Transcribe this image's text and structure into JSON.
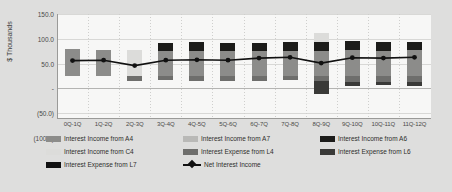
{
  "chart_data": {
    "type": "bar",
    "title": "",
    "subtitle": "",
    "xlabel": "",
    "ylabel": "$ Thousands",
    "ylim": [
      -100.0,
      150.0
    ],
    "ytick_labels": [
      "150.0",
      "100.0",
      "50.0",
      "-",
      "(50.0)",
      "(100.0)"
    ],
    "ytick_values": [
      150.0,
      100.0,
      50.0,
      0.0,
      -50.0,
      -100.0
    ],
    "grid": true,
    "grid_vertical_dotted": true,
    "legend_position": "bottom",
    "stacked": true,
    "categories": [
      "0Q-1Q",
      "1Q-2Q",
      "2Q-3Q",
      "3Q-4Q",
      "4Q-5Q",
      "5Q-6Q",
      "6Q-7Q",
      "7Q-8Q",
      "8Q-9Q",
      "9Q-10Q",
      "10Q-11Q",
      "11Q-12Q"
    ],
    "series": [
      {
        "name": "Interest Income from A4",
        "color": "#8c8c8a",
        "values": [
          65,
          63,
          0,
          62,
          60,
          60,
          60,
          62,
          62,
          64,
          62,
          64
        ]
      },
      {
        "name": "Interest Income from A7",
        "color": "#b9b9b7",
        "values": [
          0,
          0,
          0,
          0,
          0,
          0,
          0,
          0,
          0,
          0,
          0,
          0
        ]
      },
      {
        "name": "Interest Income from A6",
        "color": "#1c1c1a",
        "values": [
          0,
          0,
          0,
          18,
          22,
          21,
          21,
          20,
          20,
          21,
          21,
          19
        ]
      },
      {
        "name": "Interest Income from C4",
        "color": "#dcdcda",
        "values": [
          0,
          0,
          64,
          0,
          0,
          0,
          0,
          0,
          22,
          0,
          0,
          0
        ]
      },
      {
        "name": "Interest Expense from L4",
        "color": "#6e6e6c",
        "values": [
          0,
          0,
          -10,
          -8,
          -12,
          -10,
          -11,
          -9,
          -10,
          -14,
          -13,
          -14
        ]
      },
      {
        "name": "Interest Expense from L6",
        "color": "#3a3a38",
        "values": [
          0,
          0,
          0,
          0,
          0,
          0,
          0,
          0,
          -32,
          -8,
          -8,
          -9
        ]
      },
      {
        "name": "Interest Expense from L7",
        "color": "#111111",
        "values": [
          0,
          0,
          0,
          0,
          0,
          0,
          0,
          0,
          0,
          0,
          0,
          0
        ]
      },
      {
        "name": "Net Interest Income",
        "color": "#111111",
        "type": "line",
        "values": [
          38,
          39,
          26,
          39,
          40,
          39,
          44,
          46,
          32,
          45,
          44,
          46
        ]
      }
    ]
  },
  "axis": {
    "y_title": "$ Thousands",
    "y_ticks": [
      "150.0",
      "100.0",
      "50.0",
      "-",
      "(50.0)",
      "(100.0)"
    ],
    "x_ticks": [
      "0Q-1Q",
      "1Q-2Q",
      "2Q-3Q",
      "3Q-4Q",
      "4Q-5Q",
      "5Q-6Q",
      "6Q-7Q",
      "7Q-8Q",
      "8Q-9Q",
      "9Q-10Q",
      "10Q-11Q",
      "11Q-12Q"
    ]
  },
  "legend": {
    "rows": [
      [
        {
          "label": "Interest Income from A4",
          "color": "#8c8c8a",
          "kind": "swatch"
        },
        {
          "label": "Interest Income from A7",
          "color": "#b9b9b7",
          "kind": "swatch"
        },
        {
          "label": "Interest Income from A6",
          "color": "#1c1c1a",
          "kind": "swatch"
        }
      ],
      [
        {
          "label": "Interest Income from C4",
          "color": "#dcdcda",
          "kind": "swatch"
        },
        {
          "label": "Interest Expense from L4",
          "color": "#6e6e6c",
          "kind": "swatch"
        },
        {
          "label": "Interest Expense from L6",
          "color": "#3a3a38",
          "kind": "swatch"
        }
      ],
      [
        {
          "label": "Interest Expense from L7",
          "color": "#111111",
          "kind": "swatch"
        },
        {
          "label": "Net Interest Income",
          "color": "#111111",
          "kind": "line"
        }
      ]
    ]
  },
  "colors": {
    "page_background": "#dededd",
    "plot_background": "#f7f7f6",
    "gridline": "#d8d8d6",
    "axis": "#9a9a98",
    "text": "#3d3d3b",
    "line_series": "#111111"
  }
}
